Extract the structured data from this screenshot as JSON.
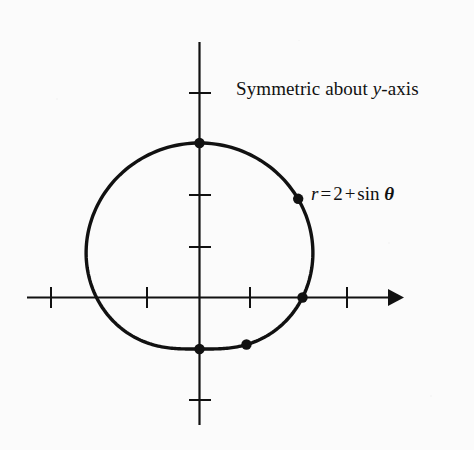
{
  "figure": {
    "background_color": "#fbfbfb",
    "ink_color": "#111111",
    "annotations": {
      "symmetry": {
        "prefix": "Symmetric about ",
        "variable": "y",
        "suffix": "-axis",
        "full_text": "Symmetric about y-axis"
      },
      "equation": {
        "lhs": "r",
        "equals": "=",
        "constant": "2",
        "plus": "+",
        "trig": "sin",
        "angle": "θ",
        "full_text": "r = 2 + sin θ"
      }
    }
  },
  "chart_data": {
    "type": "line",
    "plot_kind": "polar",
    "title": "",
    "subtitle": "",
    "xlabel": "",
    "ylabel": "",
    "equation": "r = 2 + sin θ",
    "curve_name": "limacon",
    "grid": false,
    "legend": false,
    "axes": {
      "x_axis": {
        "visible": true,
        "arrow_end": "right",
        "tick_count": 4,
        "tick_unit": 1,
        "tick_values": [
          -3,
          -2,
          1,
          2
        ],
        "range": [
          -3.7,
          3.85
        ]
      },
      "y_axis": {
        "visible": true,
        "arrow_end": "none",
        "tick_count": 4,
        "tick_unit": 1,
        "tick_values": [
          3,
          1,
          2,
          -1,
          -2
        ],
        "range": [
          -2.5,
          4.0
        ]
      }
    },
    "marked_points": [
      {
        "theta_deg": 90,
        "theta_label": "π/2",
        "r": 3,
        "x": 0.0,
        "y": 3.0
      },
      {
        "theta_deg": 45,
        "theta_label": "π/4",
        "r": 2.71,
        "x": 1.91,
        "y": 1.91
      },
      {
        "theta_deg": 0,
        "theta_label": "0",
        "r": 2,
        "x": 2.0,
        "y": 0.0
      },
      {
        "theta_deg": -45,
        "theta_label": "-π/4",
        "r": 1.29,
        "x": 0.91,
        "y": -0.91
      },
      {
        "theta_deg": 270,
        "theta_label": "3π/2",
        "r": 1,
        "x": 0.0,
        "y": -1.0
      }
    ],
    "theta": [
      0,
      15,
      30,
      45,
      60,
      75,
      90,
      105,
      120,
      135,
      150,
      165,
      180,
      195,
      210,
      225,
      240,
      255,
      270,
      285,
      300,
      315,
      330,
      345,
      360
    ],
    "r": [
      2.0,
      2.259,
      2.5,
      2.707,
      2.866,
      2.966,
      3.0,
      2.966,
      2.866,
      2.707,
      2.5,
      2.259,
      2.0,
      1.741,
      1.5,
      1.293,
      1.134,
      1.034,
      1.0,
      1.034,
      1.134,
      1.293,
      1.5,
      1.741,
      2.0
    ],
    "symmetry": "about y-axis",
    "r_max": 3,
    "r_min": 1
  }
}
